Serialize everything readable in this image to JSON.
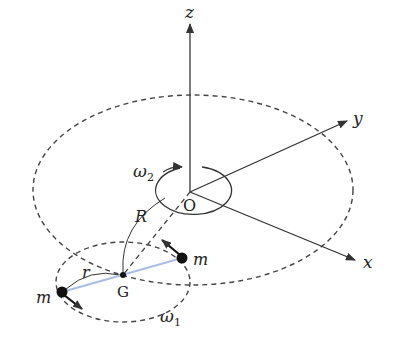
{
  "diagram": {
    "axes": {
      "z_label": "z",
      "y_label": "y",
      "x_label": "x",
      "origin_label": "O"
    },
    "labels": {
      "omega2": "ω",
      "omega2_sub": "2",
      "omega1": "ω",
      "omega1_sub": "1",
      "R": "R",
      "r": "r",
      "G": "G",
      "mass_right": "m",
      "mass_left": "m"
    },
    "colors": {
      "line": "#333333",
      "rod": "#a9bde6",
      "mass": "#111111"
    }
  }
}
